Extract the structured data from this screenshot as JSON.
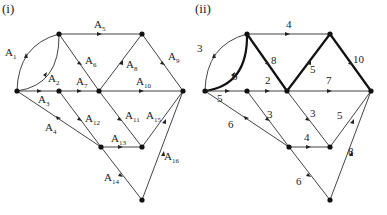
{
  "figures": [
    {
      "title": "(i)",
      "nodes": [
        {
          "id": "s",
          "x": 17,
          "y": 91
        },
        {
          "id": "a",
          "x": 59,
          "y": 34
        },
        {
          "id": "b",
          "x": 142,
          "y": 34
        },
        {
          "id": "c",
          "x": 59,
          "y": 91
        },
        {
          "id": "d",
          "x": 99,
          "y": 91
        },
        {
          "id": "t",
          "x": 183,
          "y": 91
        },
        {
          "id": "e",
          "x": 101,
          "y": 147
        },
        {
          "id": "f",
          "x": 142,
          "y": 147
        },
        {
          "id": "g",
          "x": 142,
          "y": 200
        }
      ],
      "edges": [
        {
          "label": "A1",
          "sub": "1",
          "from": "s",
          "to": "a",
          "curve": "outer"
        },
        {
          "label": "A2",
          "sub": "2",
          "from": "s",
          "to": "a",
          "curve": "inner"
        },
        {
          "label": "A3",
          "sub": "3",
          "from": "s",
          "to": "c"
        },
        {
          "label": "A4",
          "sub": "4",
          "from": "s",
          "to": "e"
        },
        {
          "label": "A5",
          "sub": "5",
          "from": "a",
          "to": "b"
        },
        {
          "label": "A6",
          "sub": "6",
          "from": "a",
          "to": "d"
        },
        {
          "label": "A7",
          "sub": "7",
          "from": "c",
          "to": "d"
        },
        {
          "label": "A8",
          "sub": "8",
          "from": "d",
          "to": "b"
        },
        {
          "label": "A9",
          "sub": "9",
          "from": "b",
          "to": "t"
        },
        {
          "label": "A10",
          "sub": "10",
          "from": "d",
          "to": "t"
        },
        {
          "label": "A11",
          "sub": "11",
          "from": "d",
          "to": "f"
        },
        {
          "label": "A12",
          "sub": "12",
          "from": "c",
          "to": "e"
        },
        {
          "label": "A13",
          "sub": "13",
          "from": "e",
          "to": "f"
        },
        {
          "label": "A14",
          "sub": "14",
          "from": "e",
          "to": "g"
        },
        {
          "label": "A15",
          "sub": "15",
          "from": "f",
          "to": "t"
        },
        {
          "label": "A16",
          "sub": "16",
          "from": "g",
          "to": "t"
        }
      ]
    },
    {
      "title": "(ii)",
      "edge_weights": {
        "s_a_outer": "3",
        "s_a_inner": "6",
        "s_c": "5",
        "s_e": "6",
        "a_b": "4",
        "a_d": "8",
        "c_d": "2",
        "d_b": "5",
        "b_t": "10",
        "d_t": "7",
        "d_f": "3",
        "c_e": "3",
        "e_f": "4",
        "e_g": "6",
        "f_t": "5",
        "g_t": "8"
      },
      "bold_path": [
        "s",
        "a",
        "d",
        "b",
        "t"
      ]
    }
  ]
}
